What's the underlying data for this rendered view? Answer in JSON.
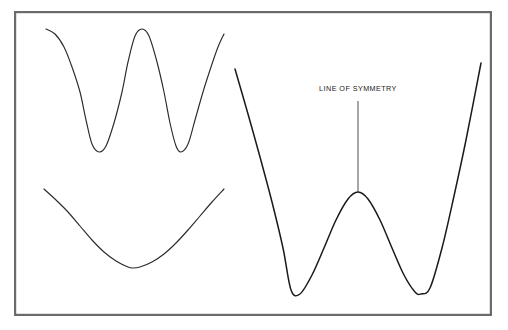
{
  "figure": {
    "background_color": "#ffffff",
    "frame": {
      "name": "figure-border",
      "x": 14,
      "y": 11,
      "width": 478,
      "height": 305,
      "stroke_color": "#6b6b6b",
      "fill_color": "#ffffff"
    },
    "annotations": {
      "symmetry_label": "LINE OF SYMMETRY"
    }
  },
  "chart_data": [
    {
      "type": "line",
      "name": "top-left-wave",
      "title": "",
      "xlabel": "",
      "ylabel": "",
      "grid": false,
      "legend": "none",
      "stroke_color": "#2b2b2b",
      "xlim": [
        46,
        224
      ],
      "ylim": [
        29,
        152
      ],
      "description": "W-shaped oscillating curve with two minima and one central maximum",
      "x": [
        46,
        55,
        64,
        72,
        80,
        86,
        92,
        99,
        106,
        114,
        122,
        128,
        135,
        142,
        149,
        157,
        164,
        170,
        176,
        181,
        188,
        195,
        203,
        211,
        218,
        224
      ],
      "y": [
        29,
        34,
        47,
        67,
        92,
        120,
        144,
        152,
        146,
        123,
        92,
        62,
        36,
        29,
        36,
        62,
        92,
        123,
        146,
        152,
        144,
        120,
        92,
        67,
        47,
        34
      ],
      "keypoints": [
        {
          "label": "left-start",
          "x": 46,
          "y": 29
        },
        {
          "label": "first-minimum",
          "x": 92,
          "y": 152
        },
        {
          "label": "center-maximum",
          "x": 135,
          "y": 29
        },
        {
          "label": "second-minimum",
          "x": 181,
          "y": 152
        },
        {
          "label": "right-end",
          "x": 224,
          "y": 29
        }
      ]
    },
    {
      "type": "line",
      "name": "bottom-left-parabola",
      "title": "",
      "xlabel": "",
      "ylabel": "",
      "grid": false,
      "legend": "none",
      "stroke_color": "#2b2b2b",
      "xlim": [
        44,
        224
      ],
      "ylim": [
        189,
        268
      ],
      "description": "Single U-shaped (parabola-like) curve with one minimum",
      "x": [
        44,
        56,
        68,
        80,
        92,
        104,
        116,
        128,
        133,
        140,
        152,
        164,
        176,
        188,
        200,
        212,
        224
      ],
      "y": [
        189,
        200,
        212,
        226,
        240,
        252,
        261,
        267,
        268,
        267,
        262,
        254,
        243,
        230,
        216,
        202,
        189
      ],
      "keypoints": [
        {
          "label": "left-start",
          "x": 44,
          "y": 189
        },
        {
          "label": "minimum",
          "x": 133,
          "y": 268
        },
        {
          "label": "right-end",
          "x": 224,
          "y": 189
        }
      ]
    },
    {
      "type": "line",
      "name": "right-quartic-curve",
      "title": "",
      "xlabel": "",
      "ylabel": "",
      "grid": false,
      "legend": "none",
      "stroke_color": "#1a1a1a",
      "xlim": [
        235,
        481
      ],
      "ylim": [
        63,
        294
      ],
      "description": "Large symmetric quartic W-curve with two minima, one local maximum at the line of symmetry",
      "x": [
        235,
        248,
        260,
        272,
        283,
        291,
        300,
        312,
        324,
        336,
        348,
        358,
        368,
        380,
        392,
        404,
        415,
        421,
        430,
        442,
        454,
        466,
        481
      ],
      "y": [
        69,
        114,
        157,
        202,
        248,
        290,
        294,
        275,
        248,
        220,
        199,
        192,
        199,
        220,
        248,
        275,
        292,
        294,
        288,
        248,
        196,
        140,
        63
      ],
      "keypoints": [
        {
          "label": "left-start",
          "x": 235,
          "y": 69
        },
        {
          "label": "left-minimum",
          "x": 291,
          "y": 294
        },
        {
          "label": "central-maximum",
          "x": 358,
          "y": 192
        },
        {
          "label": "right-minimum",
          "x": 421,
          "y": 294
        },
        {
          "label": "right-end",
          "x": 481,
          "y": 63
        }
      ],
      "annotations": [
        {
          "name": "line-of-symmetry",
          "text": "LINE OF SYMMETRY",
          "axis": "vertical",
          "x": 358,
          "y_top": 101,
          "y_bottom": 192,
          "label_x": 358,
          "label_y": 91
        }
      ]
    }
  ]
}
